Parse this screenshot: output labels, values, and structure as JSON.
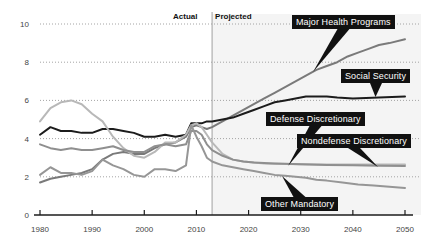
{
  "chart_data": {
    "type": "line",
    "title": "",
    "subtitle": "",
    "xlabel": "",
    "ylabel": "",
    "xlim": [
      1980,
      2050
    ],
    "ylim": [
      0,
      10
    ],
    "yticks": [
      "0",
      "2",
      "4",
      "6",
      "8",
      "10"
    ],
    "ytick_values": [
      0,
      2,
      4,
      6,
      8,
      10
    ],
    "xticks": [
      "1980",
      "1990",
      "2000",
      "2010",
      "2020",
      "2030",
      "2040",
      "2050"
    ],
    "xtick_values": [
      1980,
      1990,
      2000,
      2010,
      2020,
      2030,
      2040,
      2050
    ],
    "grid": "horizontal-dotted",
    "legend": "inline-callouts",
    "divider_year": 2013,
    "period_labels": {
      "actual": "Actual",
      "projected": "Projected"
    },
    "series": [
      {
        "name": "Major Health Programs",
        "color": "#7a7a7a",
        "x": [
          1980,
          1982,
          1984,
          1986,
          1988,
          1990,
          1992,
          1994,
          1996,
          1998,
          2000,
          2002,
          2004,
          2006,
          2008,
          2009,
          2010,
          2011,
          2012,
          2013,
          2015,
          2017,
          2019,
          2021,
          2023,
          2025,
          2027,
          2029,
          2031,
          2033,
          2035,
          2037,
          2039,
          2041,
          2043,
          2045,
          2047,
          2050
        ],
        "values": [
          1.7,
          1.9,
          2.0,
          2.1,
          2.2,
          2.4,
          2.9,
          3.2,
          3.3,
          3.2,
          3.2,
          3.5,
          3.7,
          3.8,
          4.1,
          4.6,
          4.7,
          4.6,
          4.5,
          4.6,
          4.9,
          5.2,
          5.5,
          5.8,
          6.1,
          6.4,
          6.7,
          7.0,
          7.3,
          7.6,
          7.8,
          8.0,
          8.3,
          8.5,
          8.7,
          8.9,
          9.0,
          9.2
        ]
      },
      {
        "name": "Social Security",
        "color": "#1c1c1c",
        "x": [
          1980,
          1982,
          1984,
          1986,
          1988,
          1990,
          1992,
          1994,
          1996,
          1998,
          2000,
          2002,
          2004,
          2006,
          2008,
          2009,
          2010,
          2011,
          2012,
          2013,
          2015,
          2017,
          2019,
          2021,
          2023,
          2025,
          2027,
          2029,
          2031,
          2033,
          2035,
          2037,
          2040,
          2045,
          2050
        ],
        "values": [
          4.2,
          4.6,
          4.4,
          4.4,
          4.3,
          4.3,
          4.5,
          4.5,
          4.4,
          4.3,
          4.1,
          4.1,
          4.2,
          4.1,
          4.2,
          4.8,
          4.8,
          4.8,
          4.9,
          4.9,
          5.0,
          5.1,
          5.3,
          5.5,
          5.7,
          5.9,
          6.0,
          6.1,
          6.2,
          6.2,
          6.2,
          6.15,
          6.1,
          6.15,
          6.2
        ]
      },
      {
        "name": "Defense Discretionary",
        "color": "#b8b8b8",
        "x": [
          1980,
          1982,
          1984,
          1986,
          1988,
          1990,
          1992,
          1994,
          1996,
          1998,
          2000,
          2002,
          2004,
          2006,
          2008,
          2009,
          2010,
          2011,
          2012,
          2013,
          2015,
          2017,
          2019,
          2021,
          2023,
          2025,
          2027,
          2030,
          2035,
          2040,
          2045,
          2050
        ],
        "values": [
          4.9,
          5.6,
          5.9,
          6.0,
          5.8,
          5.3,
          4.9,
          4.1,
          3.5,
          3.1,
          3.0,
          3.3,
          3.8,
          3.8,
          4.2,
          4.7,
          4.8,
          4.6,
          4.2,
          3.8,
          3.2,
          2.9,
          2.8,
          2.75,
          2.7,
          2.68,
          2.67,
          2.66,
          2.65,
          2.65,
          2.65,
          2.65
        ]
      },
      {
        "name": "Nondefense Discretionary",
        "color": "#8f8f8f",
        "x": [
          1980,
          1982,
          1984,
          1986,
          1988,
          1990,
          1992,
          1994,
          1996,
          1998,
          2000,
          2002,
          2004,
          2006,
          2008,
          2009,
          2010,
          2011,
          2012,
          2013,
          2015,
          2017,
          2019,
          2021,
          2023,
          2025,
          2027,
          2030,
          2035,
          2040,
          2045,
          2050
        ],
        "values": [
          3.7,
          3.5,
          3.4,
          3.5,
          3.4,
          3.4,
          3.5,
          3.6,
          3.4,
          3.3,
          3.3,
          3.6,
          3.7,
          3.6,
          3.7,
          4.4,
          4.4,
          4.2,
          3.7,
          3.4,
          3.1,
          2.9,
          2.8,
          2.75,
          2.72,
          2.7,
          2.68,
          2.66,
          2.62,
          2.6,
          2.58,
          2.57
        ]
      },
      {
        "name": "Other Mandatory",
        "color": "#969696",
        "x": [
          1980,
          1982,
          1984,
          1986,
          1988,
          1990,
          1992,
          1994,
          1996,
          1998,
          2000,
          2002,
          2004,
          2006,
          2008,
          2009,
          2010,
          2011,
          2012,
          2013,
          2015,
          2017,
          2019,
          2021,
          2023,
          2025,
          2027,
          2029,
          2031,
          2033,
          2035,
          2038,
          2041,
          2044,
          2047,
          2050
        ],
        "values": [
          2.1,
          2.5,
          2.2,
          2.2,
          2.1,
          2.3,
          2.9,
          2.6,
          2.4,
          2.1,
          2.0,
          2.4,
          2.4,
          2.3,
          2.6,
          4.7,
          4.1,
          3.6,
          3.0,
          2.8,
          2.6,
          2.5,
          2.4,
          2.3,
          2.2,
          2.1,
          2.05,
          2.0,
          1.95,
          1.85,
          1.8,
          1.7,
          1.6,
          1.55,
          1.48,
          1.42
        ]
      }
    ],
    "callouts": [
      {
        "label": "Major Health Programs",
        "box_x": 292,
        "box_y": 15,
        "arrow_x": 313,
        "arrow_y": 72
      },
      {
        "label": "Social Security",
        "box_x": 341,
        "box_y": 69,
        "arrow_x": 375,
        "arrow_y": 97
      },
      {
        "label": "Defense Discretionary",
        "box_x": 266,
        "box_y": 112,
        "arrow_x": 288,
        "arrow_y": 166
      },
      {
        "label": "Nondefense Discretionary",
        "box_x": 297,
        "box_y": 134,
        "arrow_x": 378,
        "arrow_y": 167
      },
      {
        "label": "Other Mandatory",
        "box_x": 261,
        "box_y": 197,
        "arrow_x": 282,
        "arrow_y": 176
      }
    ]
  }
}
